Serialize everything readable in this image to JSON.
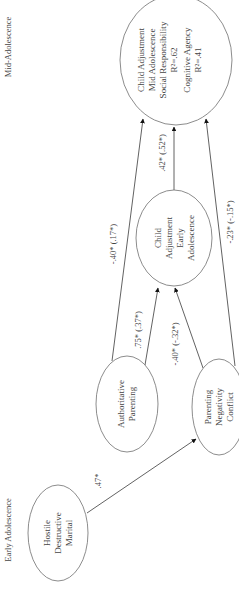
{
  "diagram": {
    "orientation": "rotated-90-ccw",
    "phases": {
      "early": "Early Adolescence",
      "mid": "Mid-Adolescence"
    },
    "nodes": {
      "hostile": {
        "lines": [
          "Hostile",
          "Destructive",
          "Marital"
        ]
      },
      "authoritative": {
        "lines": [
          "Authoritative",
          "Parenting"
        ]
      },
      "negativity": {
        "lines": [
          "Parenting",
          "Negativity",
          "Conflict"
        ]
      },
      "early_adjust": {
        "lines": [
          "Child",
          "Adjustment",
          "Early",
          "Adolescence"
        ]
      },
      "mid_adjust": {
        "lines": [
          "Child Adjustment",
          "Mid Adolescence",
          "Social Responsibility",
          "R²=.62",
          "Cognitive Agency",
          "R²=.41"
        ]
      }
    },
    "edges": {
      "hostile_to_negativity": ".47*",
      "authoritative_to_early": ".75* (.37*)",
      "negativity_to_early": "-.40* (-.32*)",
      "authoritative_to_mid": "-.40* (.17*)",
      "early_to_mid": ".42* (.52*)",
      "negativity_to_mid": "-.23* (-.15*)"
    },
    "colors": {
      "stroke": "#6e6e6e",
      "text": "#444444",
      "background": "#ffffff"
    }
  }
}
